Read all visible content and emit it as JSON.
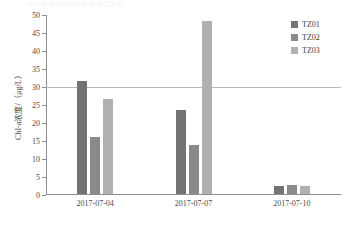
{
  "title_strip": "2017年7月台州湾叶绿素a浓度变化",
  "chart_data": {
    "type": "bar",
    "title": "2017年7月台州湾叶绿素a浓度变化",
    "xlabel": "",
    "ylabel": "Chl-a浓度/（μg/L）",
    "categories": [
      "2017-07-04",
      "2017-07-07",
      "2017-07-10"
    ],
    "series": [
      {
        "name": "TZ01",
        "color": "#737373",
        "values": [
          31.3,
          23.3,
          2.1
        ]
      },
      {
        "name": "TZ02",
        "color": "#8a8a8a",
        "values": [
          15.9,
          13.5,
          2.6
        ]
      },
      {
        "name": "TZ03",
        "color": "#b0b0b0",
        "values": [
          26.5,
          48.1,
          2.1
        ]
      }
    ],
    "ylim": [
      0,
      50
    ],
    "yticks": [
      0,
      5,
      10,
      15,
      20,
      25,
      30,
      35,
      40,
      45,
      50
    ],
    "ytick_labels": [
      "0",
      "5",
      "10",
      "15",
      "20",
      "25",
      "30",
      "35",
      "40",
      "45",
      "50"
    ],
    "grid": false,
    "legend_position": "top-right",
    "reference_line": {
      "value": 30,
      "color": "#b9b9b9",
      "label": ""
    },
    "axis_color": "#8e8e8e"
  },
  "legend": {
    "items": [
      {
        "label": "TZ01",
        "color": "#737373"
      },
      {
        "label": "TZ02",
        "color": "#8a8a8a"
      },
      {
        "label": "TZ03",
        "color": "#b0b0b0"
      }
    ]
  }
}
